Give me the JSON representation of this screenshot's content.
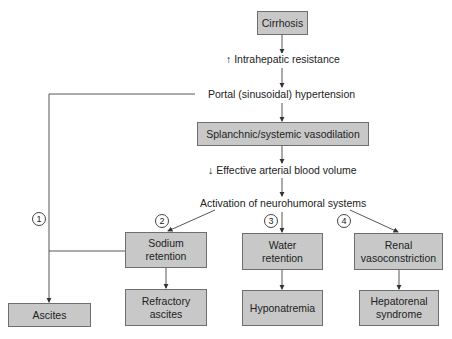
{
  "nodes": {
    "cirrhosis": "Cirrhosis",
    "intrahepatic": "↑ Intrahepatic resistance",
    "portal": "Portal (sinusoidal) hypertension",
    "splanchnic": "Splanchnic/systemic vasodilation",
    "effective": "↓ Effective arterial blood volume",
    "activation": "Activation of neurohumoral systems",
    "sodium_l1": "Sodium",
    "sodium_l2": "retention",
    "water_l1": "Water",
    "water_l2": "retention",
    "renal_l1": "Renal",
    "renal_l2": "vasoconstriction",
    "ascites": "Ascites",
    "refractory_l1": "Refractory",
    "refractory_l2": "ascites",
    "hyponatremia": "Hyponatremia",
    "hepatorenal_l1": "Hepatorenal",
    "hepatorenal_l2": "syndrome"
  },
  "markers": [
    "1",
    "2",
    "3",
    "4"
  ]
}
